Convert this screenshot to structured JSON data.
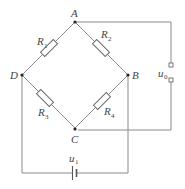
{
  "diagram": {
    "type": "wheatstone-bridge",
    "nodes": {
      "A": {
        "label": "A"
      },
      "B": {
        "label": "B"
      },
      "C": {
        "label": "C"
      },
      "D": {
        "label": "D"
      }
    },
    "resistors": [
      {
        "name": "R",
        "sub": "1",
        "between": "A-D"
      },
      {
        "name": "R",
        "sub": "2",
        "between": "A-B"
      },
      {
        "name": "R",
        "sub": "3",
        "between": "D-C"
      },
      {
        "name": "R",
        "sub": "4",
        "between": "B-C"
      }
    ],
    "output": {
      "name": "u",
      "sub": "0",
      "between": "A-C"
    },
    "source": {
      "name": "u",
      "sub": "1",
      "between": "D-B"
    },
    "colors": {
      "wire": "#8a8a8a",
      "text": "#444444",
      "node": "#222222"
    }
  }
}
